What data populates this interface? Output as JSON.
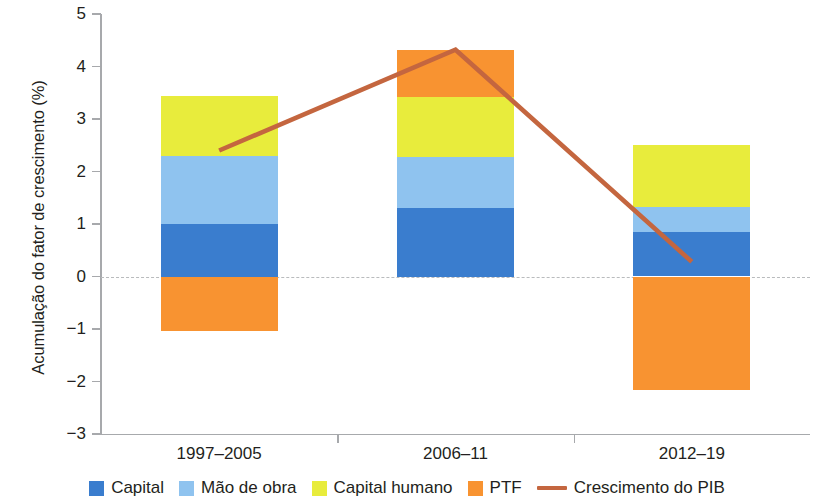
{
  "chart_data": {
    "type": "bar",
    "title": "",
    "subtitle": "",
    "xlabel": "",
    "ylabel": "Acumulação do fator de crescimento (%)",
    "categories": [
      "1997–2005",
      "2006–11",
      "2012–19"
    ],
    "ylim": [
      -3,
      5
    ],
    "yticks": [
      5,
      4,
      3,
      2,
      1,
      0,
      -1,
      -2,
      -3
    ],
    "ytick_labels": [
      "5",
      "4",
      "3",
      "2",
      "1",
      "0",
      "−1",
      "−2",
      "−3"
    ],
    "grid": false,
    "stacked": true,
    "zero_reference_line": true,
    "legend_position": "bottom",
    "series": [
      {
        "name": "Capital",
        "type": "bar",
        "color": "#3a7dce",
        "values": [
          1.0,
          1.3,
          0.84
        ]
      },
      {
        "name": "Mão de obra",
        "type": "bar",
        "color": "#8fc3ef",
        "values": [
          1.3,
          0.97,
          0.49
        ]
      },
      {
        "name": "Capital humano",
        "type": "bar",
        "color": "#e8ec3c",
        "values": [
          1.13,
          1.14,
          1.17
        ]
      },
      {
        "name": "PTF",
        "type": "bar",
        "color": "#f89331",
        "values": [
          -1.03,
          0.91,
          -2.17
        ]
      },
      {
        "name": "Crescimento do PIB",
        "type": "line",
        "color": "#c4663f",
        "values": [
          2.4,
          4.32,
          0.28
        ]
      }
    ]
  },
  "legend": {
    "items": [
      {
        "label": "Capital",
        "marker": "square-swatch",
        "color": "#3a7dce"
      },
      {
        "label": "Mão de obra",
        "marker": "square-swatch",
        "color": "#8fc3ef"
      },
      {
        "label": "Capital humano",
        "marker": "square-swatch",
        "color": "#e8ec3c"
      },
      {
        "label": "PTF",
        "marker": "square-swatch",
        "color": "#f89331"
      },
      {
        "label": "Crescimento do PIB",
        "marker": "line-swatch",
        "color": "#c4663f"
      }
    ]
  },
  "axes": {
    "y_title": "Acumulação do fator de crescimento (%)",
    "x_categories": [
      "1997–2005",
      "2006–11",
      "2012–19"
    ]
  }
}
